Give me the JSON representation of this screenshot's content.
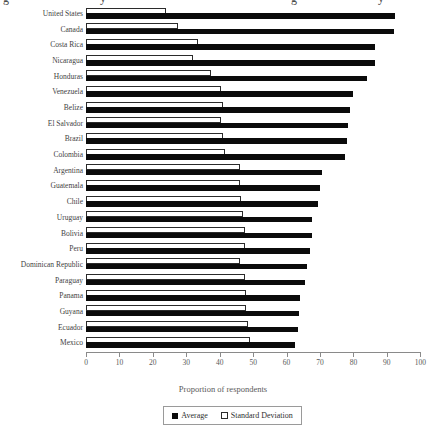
{
  "figure": {
    "cropped_title_fragments": [
      {
        "char": "g",
        "x": 3
      },
      {
        "char": "y",
        "x": 100
      },
      {
        "char": "g",
        "x": 291
      },
      {
        "char": "y",
        "x": 378
      }
    ]
  },
  "chart_data": {
    "type": "bar",
    "orientation": "horizontal",
    "title": "",
    "xlabel": "Proportion of respondents",
    "ylabel": "",
    "xlim": [
      0,
      100
    ],
    "xticks": [
      0,
      10,
      20,
      30,
      40,
      50,
      60,
      70,
      80,
      90,
      100
    ],
    "grid": false,
    "legend_position": "bottom-center",
    "categories": [
      "United States",
      "Canada",
      "Costa Rica",
      "Nicaragua",
      "Honduras",
      "Venezuela",
      "Belize",
      "El Salvador",
      "Brazil",
      "Colombia",
      "Argentina",
      "Guatemala",
      "Chile",
      "Uruguay",
      "Bolivia",
      "Peru",
      "Dominican Republic",
      "Paraguay",
      "Panama",
      "Guyana",
      "Ecuador",
      "Mexico"
    ],
    "series": [
      {
        "name": "Average",
        "swatch": "filled-black-square",
        "values": [
          92.5,
          92,
          86.5,
          86.5,
          84,
          80,
          79,
          78.5,
          78,
          77.5,
          70.5,
          70,
          69.5,
          67.5,
          67.5,
          67,
          66,
          65.5,
          64,
          63.8,
          63.5,
          62.5
        ]
      },
      {
        "name": "Standard Deviation",
        "swatch": "open-white-square",
        "values": [
          24,
          27.5,
          33.5,
          32,
          37.5,
          40.5,
          41,
          40.5,
          41,
          41.5,
          46,
          46,
          46.5,
          47,
          47.5,
          47.5,
          46,
          47.5,
          48,
          48,
          48.5,
          49
        ]
      }
    ],
    "colors": {
      "average_fill": "#0b0b0b",
      "std_dev_fill": "#ffffff",
      "std_dev_outline": "#2b2b2b",
      "background": "#ffffff"
    }
  },
  "legend": {
    "items": [
      {
        "label": "Average",
        "swatch": "filled"
      },
      {
        "label": "Standard Deviation",
        "swatch": "open"
      }
    ]
  }
}
